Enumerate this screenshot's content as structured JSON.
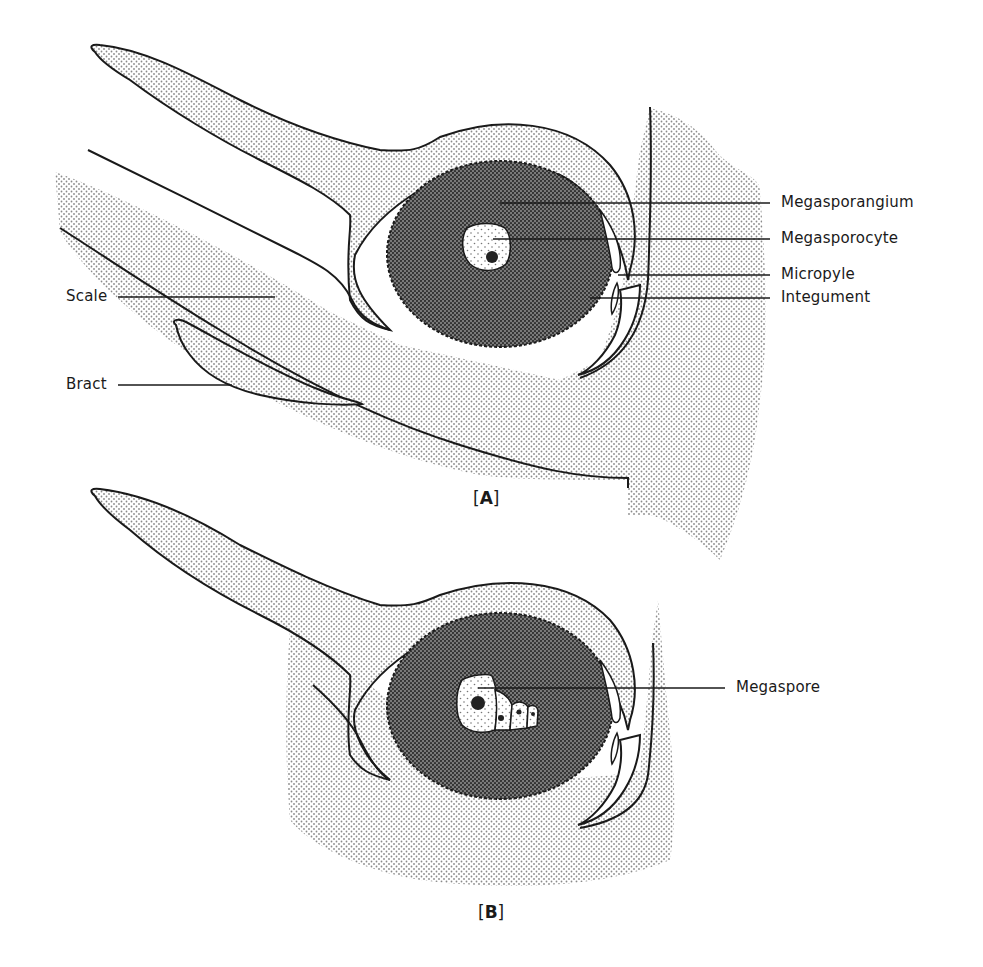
{
  "figure": {
    "panels": [
      {
        "id": "A",
        "label_open": "[",
        "label_letter": "A",
        "label_close": "]",
        "labels": {
          "megasporangium": "Megasporangium",
          "megasporocyte": "Megasporocyte",
          "micropyle": "Micropyle",
          "integument": "Integument",
          "scale": "Scale",
          "bract": "Bract"
        }
      },
      {
        "id": "B",
        "label_open": "[",
        "label_letter": "B",
        "label_close": "]",
        "labels": {
          "megaspore": "Megaspore"
        }
      }
    ],
    "colors": {
      "background": "#ffffff",
      "outline": "#1a1a1a",
      "light_stipple": "#9a9a9a",
      "dark_stipple": "#4a4a4a"
    }
  }
}
